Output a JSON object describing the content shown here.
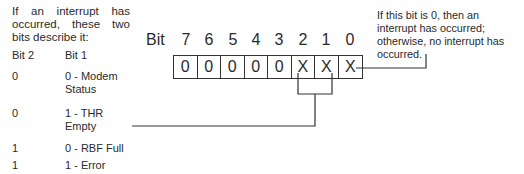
{
  "intro_text": "If an interrupt has occurred, these two bits describe it:",
  "table": {
    "headers": [
      "Bit 2",
      "Bit 1"
    ],
    "rows": [
      {
        "bit2": "0",
        "bit1": "0 - Modem Status"
      },
      {
        "bit2": "0",
        "bit1": "1 - THR Empty"
      },
      {
        "bit2": "1",
        "bit1": "0 - RBF Full"
      },
      {
        "bit2": "1",
        "bit1": "1 - Error"
      }
    ]
  },
  "register": {
    "label": "Bit",
    "bit_numbers": [
      "7",
      "6",
      "5",
      "4",
      "3",
      "2",
      "1",
      "0"
    ],
    "values": [
      "0",
      "0",
      "0",
      "0",
      "0",
      "X",
      "X",
      "X"
    ]
  },
  "bit0_note": "If this bit is 0, then an interrupt has occurred; otherwise, no interrupt has occurred.",
  "colors": {
    "line": "#333333",
    "text": "#2a2a2a",
    "background": "#ffffff"
  }
}
